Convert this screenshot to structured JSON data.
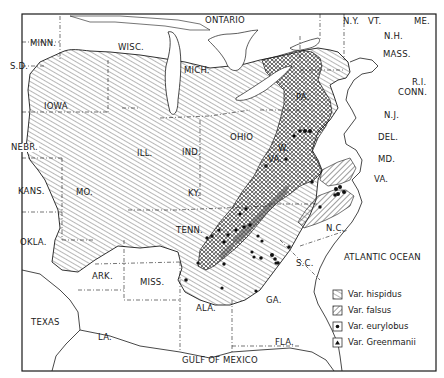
{
  "map": {
    "title": "",
    "frame": {
      "left": 22,
      "top": 14,
      "right": 436,
      "bottom": 371
    },
    "colors": {
      "ink": "#1a1a1a",
      "background": "#ffffff",
      "hatch": "#555555"
    },
    "labels": {
      "ontario": "ONTARIO",
      "ny": "N.Y.",
      "vt": "VT.",
      "me": "ME.",
      "nh": "N.H.",
      "mass": "MASS.",
      "ri": "R.I.",
      "conn": "CONN.",
      "nj": "N.J.",
      "del": "DEL.",
      "md": "MD.",
      "va_east": "VA.",
      "minn": "MINN.",
      "wisc": "WISC.",
      "mich": "MICH.",
      "sd": "S.D.",
      "iowa": "IOWA",
      "pa": "PA.",
      "nebr": "NEBR.",
      "ill": "ILL.",
      "ind": "IND.",
      "ohio": "OHIO",
      "w": "W.",
      "va_west": "VA.",
      "kans": "KANS.",
      "mo": "MO.",
      "ky": "KY.",
      "okla": "OKLA.",
      "tenn": "TENN.",
      "nc": "N.C.",
      "atlantic": "ATLANTIC OCEAN",
      "sc": "S.C.",
      "ark": "ARK.",
      "miss": "MISS.",
      "ala": "ALA.",
      "ga": "GA.",
      "texas": "TEXAS",
      "la": "LA.",
      "fla": "FLA.",
      "gulf": "GULF OF MEXICO"
    },
    "legend": [
      {
        "symbol": "hatch-fine",
        "label": "Var. hispidus"
      },
      {
        "symbol": "hatch-coarse",
        "label": "Var. falsus"
      },
      {
        "symbol": "dot",
        "label": "Var. eurylobus"
      },
      {
        "symbol": "triangle",
        "label": "Var. Greenmanii"
      }
    ]
  }
}
